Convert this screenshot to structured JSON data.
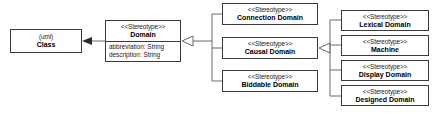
{
  "diagram": {
    "background_color": "#ffffff",
    "line_color": "#6a6a6a",
    "border_color": "#3a3a3a",
    "text_color": "#000000"
  },
  "boxes": {
    "uml_class": {
      "stereotype": "(uml)",
      "name": "Class"
    },
    "domain": {
      "stereotype": "<<Stereotype>>",
      "name": "Domain",
      "attributes": [
        "abbreviation: String",
        "description: String"
      ]
    },
    "connection_domain": {
      "stereotype": "<<Stereotype>>",
      "name": "Connection Domain"
    },
    "causal_domain": {
      "stereotype": "<<Stereotype>>",
      "name": "Causal Domain"
    },
    "biddable_domain": {
      "stereotype": "<<Stereotype>>",
      "name": "Biddable Domain"
    },
    "lexical_domain": {
      "stereotype": "<<Stereotype>>",
      "name": "Lexical Domain"
    },
    "machine": {
      "stereotype": "<<Stereotype>>",
      "name": "Machine"
    },
    "display_domain": {
      "stereotype": "<<Stereotype>>",
      "name": "Display Domain"
    },
    "designed_domain": {
      "stereotype": "<<Stereotype>>",
      "name": "Designed Domain"
    }
  },
  "connectors": [
    {
      "id": "domain-to-class",
      "from": "domain",
      "to": "uml_class",
      "arrow": "solid-filled-arrowhead"
    },
    {
      "id": "domain-subtypes",
      "from": [
        "connection_domain",
        "causal_domain",
        "biddable_domain"
      ],
      "to": "domain",
      "arrow": "hollow-triangle-generalization"
    },
    {
      "id": "causal-subtypes",
      "from": [
        "lexical_domain",
        "machine",
        "display_domain",
        "designed_domain"
      ],
      "to": "causal_domain",
      "arrow": "hollow-triangle-generalization"
    }
  ]
}
